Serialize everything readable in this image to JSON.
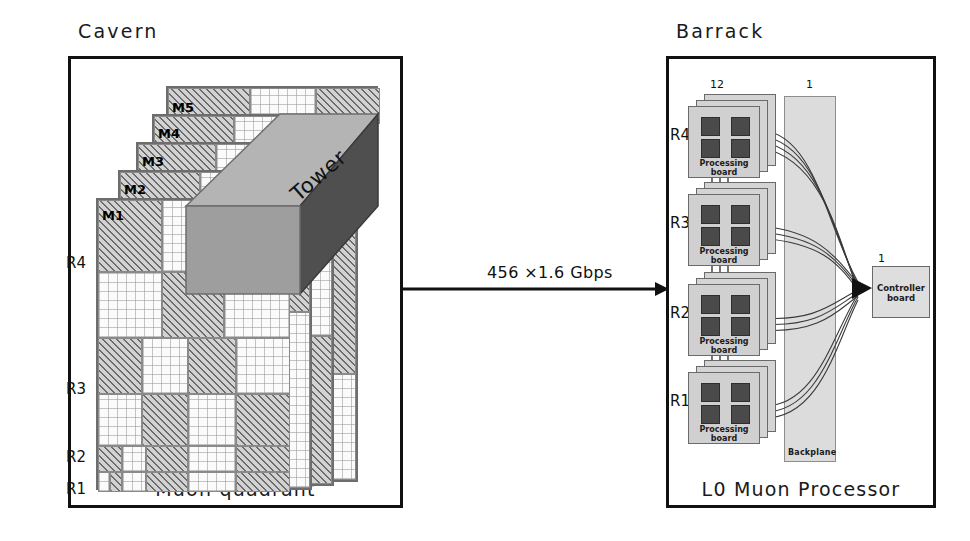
{
  "left_panel": {
    "title": "Cavern",
    "caption": "Muon quadrant",
    "tower_label": "Tower",
    "station_labels": [
      "M1",
      "M2",
      "M3",
      "M4",
      "M5"
    ],
    "region_labels": [
      "R4",
      "R3",
      "R2",
      "R1"
    ]
  },
  "link": {
    "label": "456 ×1.6 Gbps"
  },
  "right_panel": {
    "title": "Barrack",
    "caption": "L0 Muon Processor",
    "board_count_label": "12",
    "backplane_count_label": "1",
    "controller_count_label": "1",
    "backplane_label": "Backplane",
    "controller_label_line1": "Controller",
    "controller_label_line2": "board",
    "board_label_line1": "Processing",
    "board_label_line2": "board",
    "rows": [
      {
        "region": "R4"
      },
      {
        "region": "R3"
      },
      {
        "region": "R2"
      },
      {
        "region": "R1"
      }
    ]
  },
  "colors": {
    "frame": "#111111",
    "hatch_fill": "#d2d2d2",
    "board_fill": "#d4d4d4",
    "chip_fill": "#4a4a4a",
    "backplane_fill": "#dcdcdc",
    "top_face": "#b4b4b4",
    "side_face": "#4f4f4f"
  }
}
